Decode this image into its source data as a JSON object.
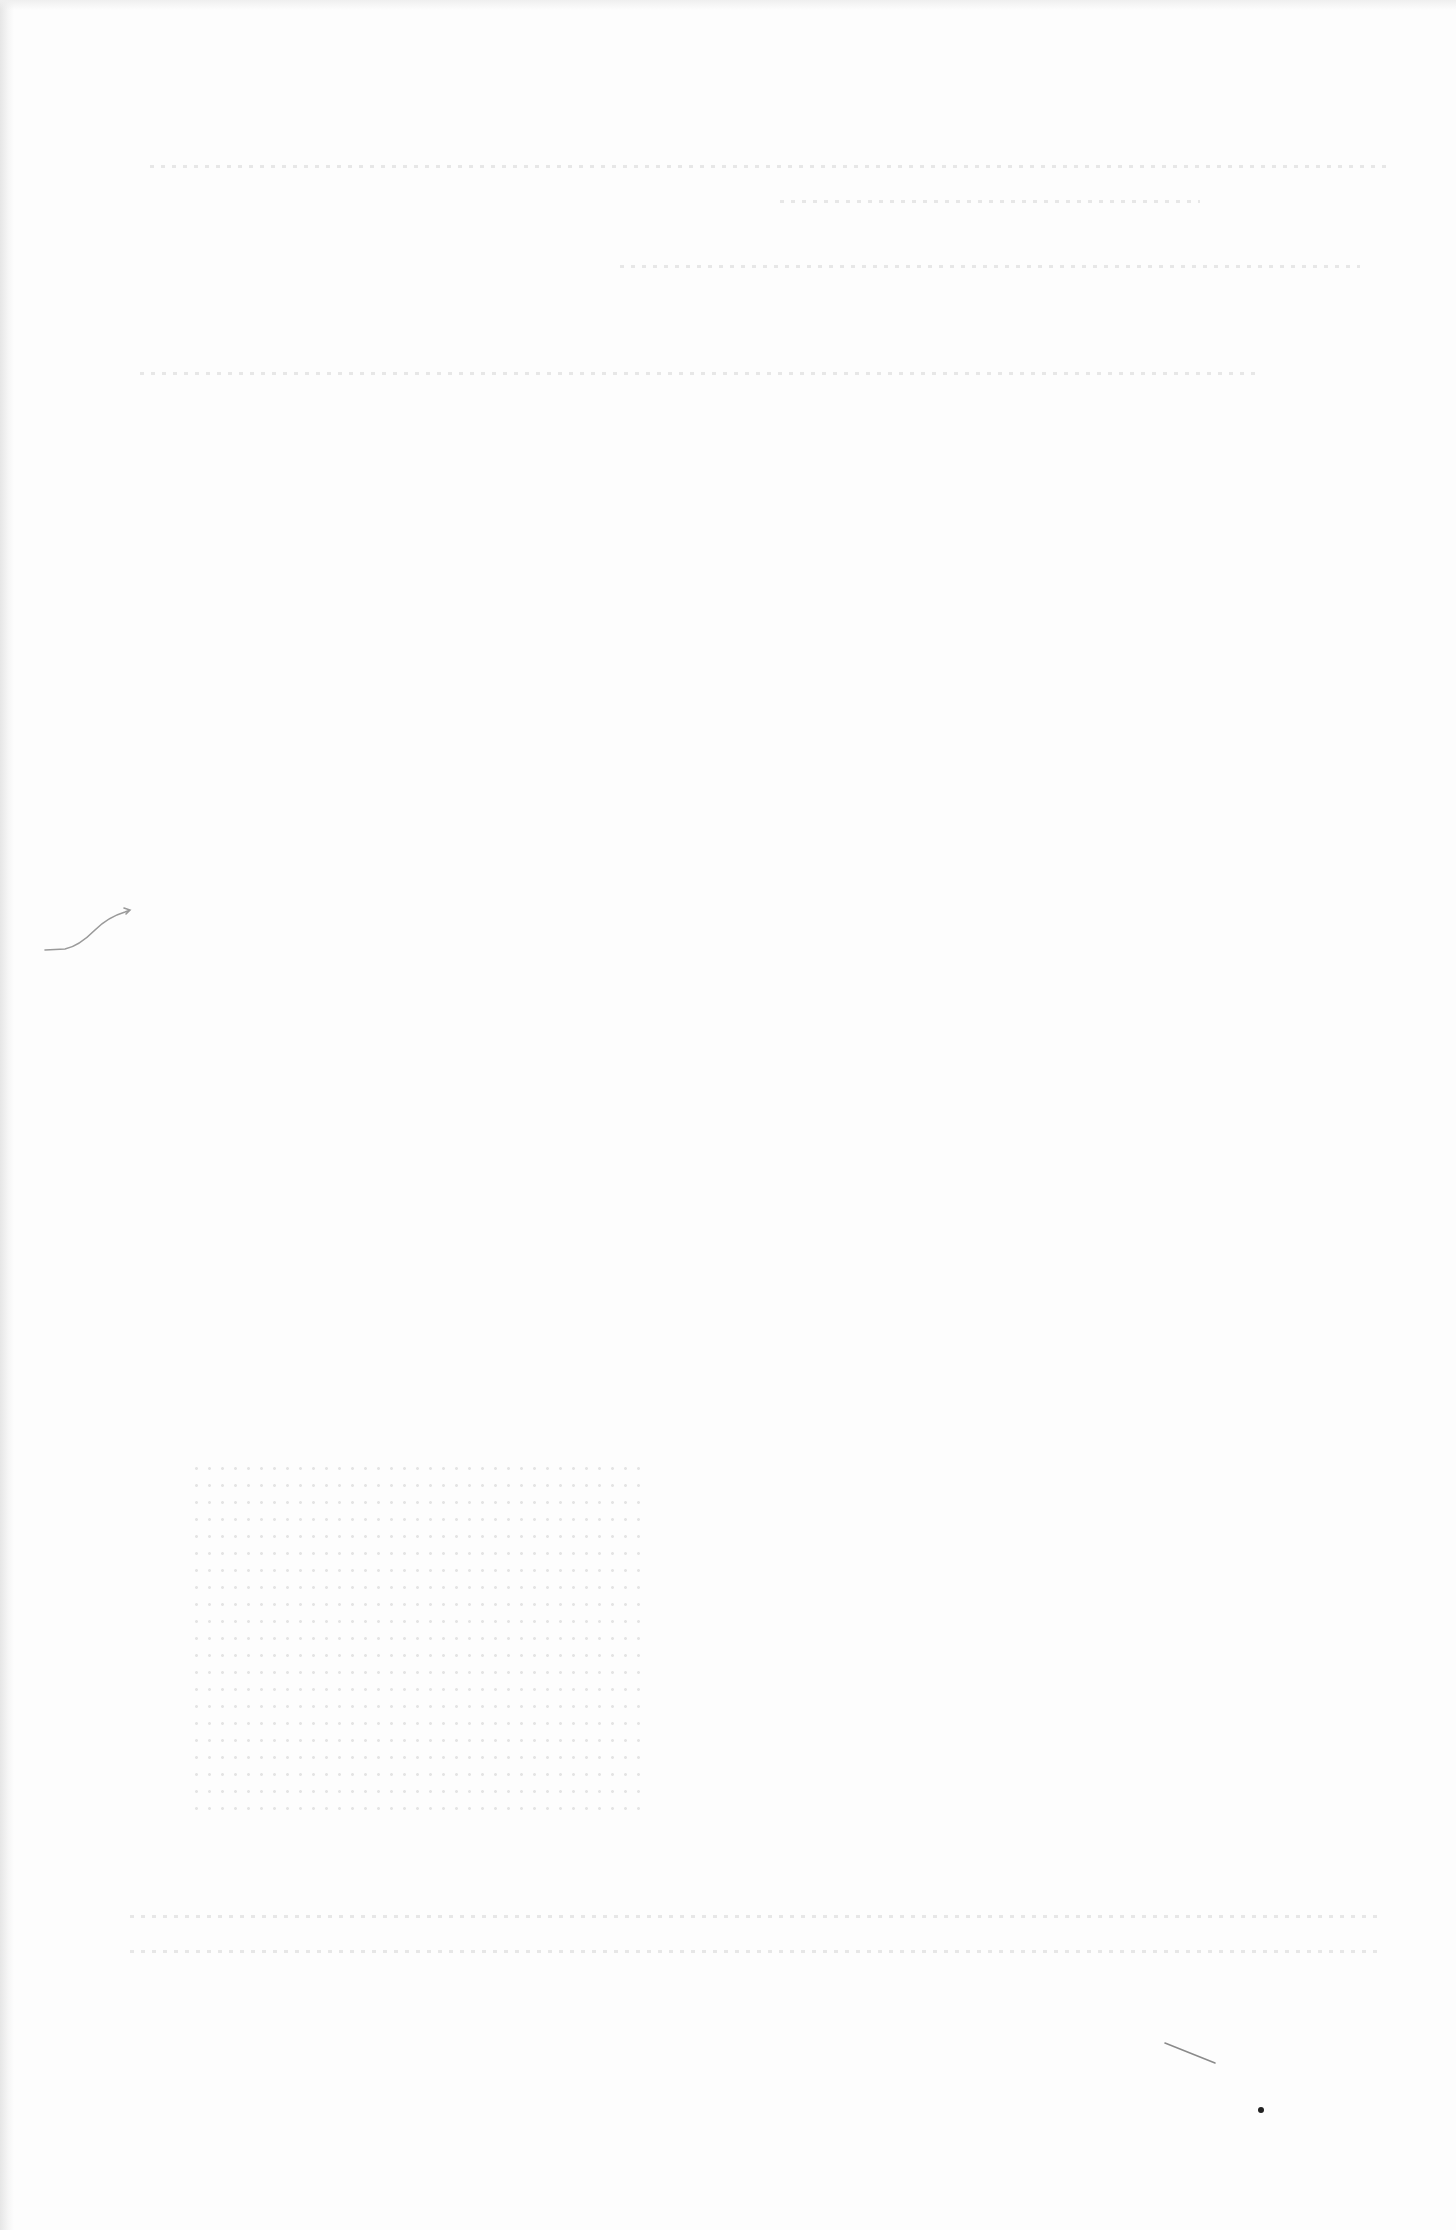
{
  "page": {
    "type": "blank scanned page",
    "background_color": "#fdfdfd",
    "text": ""
  },
  "marks": {
    "pencil_squiggle": {
      "x": 45,
      "y": 910,
      "color": "#9a9a9a"
    },
    "stray_stroke": {
      "x": 1165,
      "y": 2045,
      "color": "#8a8a8a"
    },
    "ink_dot": {
      "x": 1260,
      "y": 2110,
      "color": "#222222"
    }
  }
}
